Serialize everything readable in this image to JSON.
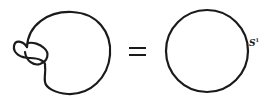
{
  "diagram": {
    "operator": "=",
    "right_label": {
      "base": "S",
      "superscript": "1"
    },
    "stroke_color": "#1a1a1a",
    "background": "#ffffff"
  }
}
